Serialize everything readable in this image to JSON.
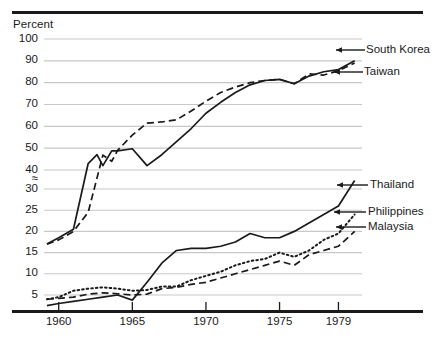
{
  "chart_data": {
    "type": "line",
    "title": "",
    "subtitle": "",
    "ylabel": "Percent",
    "xlabel": "",
    "grid": true,
    "legend_position": "right-inline-arrows",
    "axis_break": {
      "symbol": "≈",
      "between": [
        30,
        40
      ],
      "note": "y-axis scale break between 30 and 40"
    },
    "yticks": [
      5,
      10,
      15,
      20,
      25,
      30,
      40,
      50,
      60,
      70,
      80,
      90,
      100
    ],
    "ytick_labels": [
      "5",
      "10",
      "15",
      "20",
      "25",
      "30",
      "40",
      "50",
      "60",
      "70",
      "80",
      "90",
      "100"
    ],
    "ylim": [
      2,
      100
    ],
    "xticks": [
      1960,
      1965,
      1970,
      1975,
      1979
    ],
    "xtick_labels": [
      "1960",
      "1965",
      "1970",
      "1975",
      "1979"
    ],
    "xlim": [
      1959,
      1981
    ],
    "series": [
      {
        "name": "South Korea",
        "style": "solid",
        "x": [
          1959.2,
          1960,
          1961,
          1962,
          1962.6,
          1963,
          1963.6,
          1964,
          1965,
          1966,
          1967,
          1968,
          1969,
          1970,
          1971,
          1972,
          1973,
          1974,
          1975,
          1976,
          1977,
          1978,
          1979,
          1980.1
        ],
        "values": [
          17,
          18.5,
          20.5,
          36,
          47,
          42,
          39,
          39,
          39.5,
          42,
          47,
          53,
          59,
          66,
          71,
          75.5,
          79,
          81,
          81.5,
          79.5,
          83,
          85,
          86,
          90
        ]
      },
      {
        "name": "Taiwan",
        "style": "dashed",
        "x": [
          1959.2,
          1960,
          1961,
          1962,
          1963,
          1963.6,
          1964,
          1965,
          1966,
          1967,
          1968,
          1969,
          1970,
          1971,
          1972,
          1973,
          1974,
          1975,
          1976,
          1977,
          1978,
          1979,
          1980.1
        ],
        "values": [
          17,
          18,
          20,
          24.5,
          38,
          44,
          49,
          56,
          61.5,
          62,
          63,
          67,
          71.5,
          75.5,
          78,
          80,
          81,
          81.5,
          79.5,
          84,
          83.5,
          85.5,
          89
        ]
      },
      {
        "name": "Thailand",
        "style": "solid",
        "x": [
          1959.2,
          1960,
          1961,
          1962,
          1963,
          1964,
          1965,
          1966,
          1967,
          1968,
          1969,
          1970,
          1971,
          1972,
          1973,
          1974,
          1975,
          1976,
          1977,
          1978,
          1979,
          1980.1
        ],
        "values": [
          2.5,
          3,
          3.5,
          4,
          4.5,
          5,
          3.8,
          8,
          12.5,
          15.5,
          16,
          16,
          16.5,
          17.5,
          19.5,
          18.5,
          18.5,
          20,
          22,
          24,
          26,
          32
        ]
      },
      {
        "name": "Philippines",
        "style": "dashed",
        "x": [
          1959.2,
          1960,
          1961,
          1962,
          1963,
          1964,
          1965,
          1966,
          1967,
          1968,
          1969,
          1970,
          1971,
          1972,
          1973,
          1974,
          1975,
          1976,
          1977,
          1978,
          1979,
          1980.1
        ],
        "values": [
          4,
          4.2,
          4.5,
          5.2,
          5.5,
          5.3,
          5,
          5.2,
          6.5,
          6.8,
          7.5,
          8,
          9,
          10,
          11,
          12,
          13,
          12,
          14.5,
          15.5,
          16.5,
          20
        ]
      },
      {
        "name": "Malaysia",
        "style": "dotted",
        "x": [
          1959.2,
          1960,
          1961,
          1962,
          1963,
          1964,
          1965,
          1966,
          1967,
          1968,
          1969,
          1970,
          1971,
          1972,
          1973,
          1974,
          1975,
          1976,
          1977,
          1978,
          1979,
          1980.1
        ],
        "values": [
          4,
          4.5,
          6,
          6.5,
          6.8,
          6.5,
          6,
          6.2,
          7,
          7,
          8.5,
          9.5,
          10.5,
          12,
          13,
          13.5,
          15,
          14,
          15.5,
          18,
          19.5,
          24
        ]
      }
    ],
    "labels": [
      {
        "text": "South Korea",
        "series": "South Korea"
      },
      {
        "text": "Taiwan",
        "series": "Taiwan"
      },
      {
        "text": "Thailand",
        "series": "Thailand"
      },
      {
        "text": "Philippines",
        "series": "Philippines"
      },
      {
        "text": "Malaysia",
        "series": "Malaysia"
      }
    ],
    "colors": {
      "ink": "#1a1a1a",
      "grid": "#c8c8c8",
      "background": "#ffffff"
    }
  }
}
